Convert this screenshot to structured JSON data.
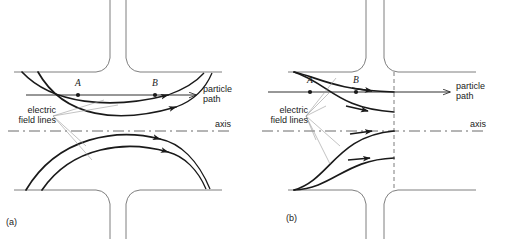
{
  "figure": {
    "type": "physics-diagram",
    "panels": [
      {
        "id": "a",
        "caption": "(a)",
        "labels": {
          "point_a": "A",
          "point_b": "B",
          "field_lines": "electric\nfield lines",
          "particle_path": "particle\npath",
          "axis": "axis"
        }
      },
      {
        "id": "b",
        "caption": "(b)",
        "labels": {
          "point_a": "A",
          "point_b": "B",
          "field_lines": "electric\nfield lines",
          "particle_path": "particle\npath",
          "axis": "axis"
        }
      }
    ]
  },
  "colors": {
    "ink": "#1a1a1a",
    "electrode": "#6f6f6f",
    "leader": "#9a9a9a",
    "axis": "#5a5a5a",
    "background": "#ffffff"
  }
}
